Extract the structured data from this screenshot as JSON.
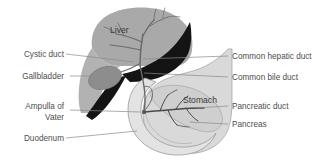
{
  "figure": {
    "background_color": "#ffffff"
  },
  "colors": {
    "liver_fill": "#a9a9a9",
    "liver_dark_lobe": "#141414",
    "gallbladder_fill": "#8d8d8d",
    "stomach_fill": "#d9d9d9",
    "duodenum_fill": "#e0e0e0",
    "pancreas_fill": "#cfcfcf",
    "duct_stroke": "#6b6b6b",
    "leader_line": "#8a8a8a",
    "label_text": "#4d4d4d",
    "organ_text": "#3a3a3a"
  },
  "labels_left": [
    {
      "id": "cystic-duct",
      "text": "Cystic duct"
    },
    {
      "id": "gallbladder",
      "text": "Gallbladder"
    },
    {
      "id": "ampulla-of-vater-line1",
      "text": "Ampulla of"
    },
    {
      "id": "ampulla-of-vater-line2",
      "text": "Vater"
    },
    {
      "id": "duodenum",
      "text": "Duodenum"
    }
  ],
  "labels_right": [
    {
      "id": "common-hepatic-duct",
      "text": "Common hepatic duct"
    },
    {
      "id": "common-bile-duct",
      "text": "Common bile duct"
    },
    {
      "id": "pancreatic-duct",
      "text": "Pancreatic duct"
    },
    {
      "id": "pancreas",
      "text": "Pancreas"
    }
  ],
  "labels_inline": [
    {
      "id": "liver",
      "text": "Liver"
    },
    {
      "id": "stomach",
      "text": "Stomach"
    }
  ]
}
